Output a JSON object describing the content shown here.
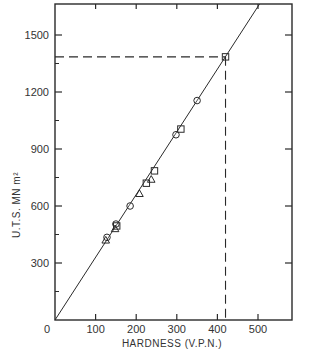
{
  "chart_data": {
    "type": "scatter",
    "title": "",
    "xlabel": "HARDNESS (V.P.N.)",
    "ylabel": "U.T.S. MN m²",
    "xlim": [
      0,
      580
    ],
    "ylim": [
      0,
      1680
    ],
    "x_ticks": [
      0,
      100,
      200,
      300,
      400,
      500
    ],
    "y_ticks": [
      300,
      600,
      900,
      1200,
      1500
    ],
    "y_minor_ticks": [
      150,
      450,
      750,
      1050,
      1350
    ],
    "grid": false,
    "legend": null,
    "series": [
      {
        "name": "circle",
        "marker": "circle",
        "points": [
          [
            128,
            435
          ],
          [
            150,
            505
          ],
          [
            185,
            600
          ],
          [
            298,
            975
          ],
          [
            350,
            1155
          ]
        ]
      },
      {
        "name": "triangle",
        "marker": "triangle",
        "points": [
          [
            125,
            420
          ],
          [
            148,
            480
          ],
          [
            208,
            665
          ],
          [
            237,
            740
          ]
        ]
      },
      {
        "name": "square",
        "marker": "square",
        "points": [
          [
            152,
            495
          ],
          [
            225,
            720
          ],
          [
            245,
            785
          ],
          [
            310,
            1005
          ],
          [
            420,
            1385
          ]
        ]
      }
    ],
    "fit_line": {
      "x": [
        0,
        515
      ],
      "y": [
        0,
        1700
      ],
      "style": "solid"
    },
    "annotations": [
      {
        "type": "dashed-horizontal",
        "from_x": 0,
        "to_x": 420,
        "y": 1385
      },
      {
        "type": "dashed-vertical",
        "x": 420,
        "from_y": 0,
        "to_y": 1385
      }
    ]
  },
  "labels": {
    "x_title": "HARDNESS (V.P.N.)",
    "y_title": "U.T.S. MN m²",
    "origin": "0"
  }
}
